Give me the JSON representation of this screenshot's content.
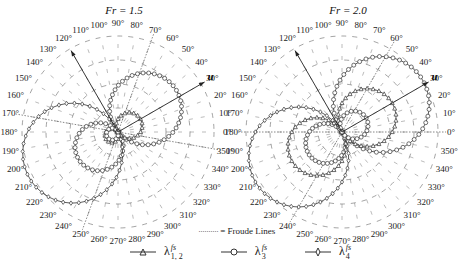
{
  "chart_data": [
    {
      "type": "polar",
      "title": "Fr = 1.5",
      "angle_ticks": [
        "0°",
        "10°",
        "20°",
        "30°",
        "40°",
        "50°",
        "60°",
        "70°",
        "80°",
        "90°",
        "100°",
        "110°",
        "120°",
        "130°",
        "140°",
        "150°",
        "160°",
        "170°",
        "180°",
        "190°",
        "200°",
        "210°",
        "220°",
        "230°",
        "240°",
        "250°",
        "260°",
        "270°",
        "280°",
        "290°",
        "300°",
        "310°",
        "320°",
        "330°",
        "340°",
        "350°"
      ],
      "grid": "dashed concentric circles and radial spokes",
      "arrows": [
        {
          "label": "u",
          "angle_deg": 30
        },
        {
          "label": "",
          "angle_deg": 120
        }
      ],
      "froude_lines_deg": [
        70,
        250,
        170,
        350
      ],
      "series": [
        {
          "name": "λ_{1,2}^{fs}",
          "marker": "triangle",
          "shape": "two lobes along 30°/210° axis, small"
        },
        {
          "name": "λ_3^{fs}",
          "marker": "circle",
          "shape": "two large lobes: one toward ~45°, one toward ~225° (smaller)"
        },
        {
          "name": "λ_4^{fs}",
          "marker": "diamond",
          "shape": "lobe toward ~200°, largest radius on left side"
        }
      ]
    },
    {
      "type": "polar",
      "title": "Fr = 2.0",
      "angle_ticks": [
        "0°",
        "10°",
        "20°",
        "30°",
        "40°",
        "50°",
        "60°",
        "70°",
        "80°",
        "90°",
        "100°",
        "110°",
        "120°",
        "130°",
        "140°",
        "150°",
        "160°",
        "170°",
        "180°",
        "190°",
        "200°",
        "210°",
        "220°",
        "230°",
        "240°",
        "250°",
        "260°",
        "270°",
        "280°",
        "290°",
        "300°",
        "310°",
        "320°",
        "330°",
        "340°",
        "350°"
      ],
      "grid": "dashed concentric circles and radial spokes",
      "arrows": [
        {
          "label": "u",
          "angle_deg": 30
        },
        {
          "label": "",
          "angle_deg": 120
        }
      ],
      "froude_lines_deg": [
        60,
        240,
        180,
        0
      ],
      "series": [
        {
          "name": "λ_{1,2}^{fs}",
          "marker": "triangle",
          "shape": "medium lobes along 30°/210° axis"
        },
        {
          "name": "λ_3^{fs}",
          "marker": "circle",
          "shape": "large lobe toward ~30°, small loop toward 210°"
        },
        {
          "name": "λ_4^{fs}",
          "marker": "diamond",
          "shape": "large lobe toward ~210°"
        }
      ]
    }
  ],
  "legend": {
    "froude": "= Froude Lines",
    "items": [
      {
        "label": "λ",
        "sup": "fs",
        "sub": "1, 2",
        "marker": "triangle"
      },
      {
        "label": "λ",
        "sup": "fs",
        "sub": "3",
        "marker": "circle"
      },
      {
        "label": "λ",
        "sup": "fs",
        "sub": "4",
        "marker": "diamond"
      }
    ]
  },
  "titles": {
    "left": "Fr = 1.5",
    "right": "Fr = 2.0"
  },
  "arrow_label": "u"
}
